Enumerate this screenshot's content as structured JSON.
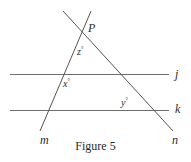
{
  "figure": {
    "caption": "Figure 5",
    "background_color": "#ffffff",
    "stroke_color": "#555555",
    "text_color": "#2b2b2b",
    "width": 191,
    "height": 162
  },
  "point_labels": [
    {
      "id": "P",
      "text": "P",
      "x": 88,
      "y": 22
    }
  ],
  "line_labels": [
    {
      "id": "j",
      "text": "j",
      "x": 175,
      "y": 68
    },
    {
      "id": "k",
      "text": "k",
      "x": 175,
      "y": 103
    },
    {
      "id": "m",
      "text": "m",
      "x": 40,
      "y": 134
    },
    {
      "id": "n",
      "text": "n",
      "x": 172,
      "y": 134
    }
  ],
  "angle_labels": [
    {
      "id": "z",
      "variable": "z",
      "degree": "°",
      "x": 77,
      "y": 46
    },
    {
      "id": "x",
      "variable": "x",
      "degree": "°",
      "x": 63,
      "y": 78
    },
    {
      "id": "y",
      "variable": "y",
      "degree": "°",
      "x": 121,
      "y": 97
    }
  ],
  "segments": [
    {
      "id": "line-j",
      "name": "horizontal-line-j",
      "x1": 10,
      "y1": 74,
      "x2": 169,
      "y2": 74,
      "color": "#6e6e6e",
      "width": 1
    },
    {
      "id": "line-k",
      "name": "horizontal-line-k",
      "x1": 10,
      "y1": 110,
      "x2": 169,
      "y2": 110,
      "color": "#6e6e6e",
      "width": 1
    },
    {
      "id": "line-m",
      "name": "transversal-line-m",
      "x1": 91,
      "y1": 11,
      "x2": 40,
      "y2": 131,
      "color": "#555555",
      "width": 1
    },
    {
      "id": "line-n",
      "name": "transversal-line-n",
      "x1": 63,
      "y1": 11,
      "x2": 173,
      "y2": 131,
      "color": "#555555",
      "width": 1
    }
  ]
}
